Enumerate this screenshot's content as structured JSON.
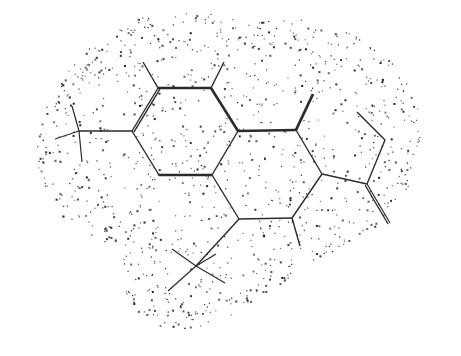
{
  "figure": {
    "type": "molecular-structure-diagram",
    "background_color": "#ffffff",
    "bond_color": "#2b2b2b",
    "dot_color": "#1c1c1c",
    "width": 461,
    "height": 356,
    "caption": ""
  },
  "chart_data": {
    "type": "scatter",
    "xlabel": "",
    "ylabel": "",
    "grid": false,
    "legend": null,
    "xlim": [
      0,
      461
    ],
    "ylim": [
      0,
      356
    ],
    "atoms": [
      {
        "id": "A1",
        "x": 158,
        "y": 88
      },
      {
        "id": "A2",
        "x": 211,
        "y": 88
      },
      {
        "id": "A3",
        "x": 238,
        "y": 131
      },
      {
        "id": "A4",
        "x": 212,
        "y": 175
      },
      {
        "id": "A5",
        "x": 159,
        "y": 175
      },
      {
        "id": "A6",
        "x": 132,
        "y": 131
      },
      {
        "id": "A7",
        "x": 296,
        "y": 130
      },
      {
        "id": "A8",
        "x": 322,
        "y": 174
      },
      {
        "id": "A9",
        "x": 292,
        "y": 218
      },
      {
        "id": "A10",
        "x": 239,
        "y": 219
      },
      {
        "id": "A11",
        "x": 367,
        "y": 184
      },
      {
        "id": "A12",
        "x": 385,
        "y": 140
      },
      {
        "id": "A13",
        "x": 357,
        "y": 112
      },
      {
        "id": "M1",
        "x": 143,
        "y": 62
      },
      {
        "id": "M2",
        "x": 224,
        "y": 62
      },
      {
        "id": "M3",
        "x": 313,
        "y": 94
      },
      {
        "id": "M4",
        "x": 300,
        "y": 246
      },
      {
        "id": "D1",
        "x": 390,
        "y": 223
      },
      {
        "id": "T1",
        "x": 79,
        "y": 131
      },
      {
        "id": "T1a",
        "x": 72,
        "y": 106
      },
      {
        "id": "T1b",
        "x": 55,
        "y": 139
      },
      {
        "id": "T1c",
        "x": 82,
        "y": 162
      },
      {
        "id": "T2",
        "x": 196,
        "y": 266
      },
      {
        "id": "T2a",
        "x": 172,
        "y": 249
      },
      {
        "id": "T2b",
        "x": 168,
        "y": 291
      },
      {
        "id": "T2c",
        "x": 225,
        "y": 283
      },
      {
        "id": "T2d",
        "x": 216,
        "y": 254
      }
    ],
    "bonds": [
      {
        "from": "A1",
        "to": "A2",
        "order": 1,
        "width": 2.6
      },
      {
        "from": "A2",
        "to": "A3",
        "order": 1,
        "width": 2.6
      },
      {
        "from": "A3",
        "to": "A4",
        "order": 1,
        "width": 1.4
      },
      {
        "from": "A4",
        "to": "A5",
        "order": 1,
        "width": 2.6
      },
      {
        "from": "A5",
        "to": "A6",
        "order": 1,
        "width": 1.4
      },
      {
        "from": "A6",
        "to": "A1",
        "order": 2,
        "width": 1.4
      },
      {
        "from": "A3",
        "to": "A7",
        "order": 1,
        "width": 2.6
      },
      {
        "from": "A7",
        "to": "A8",
        "order": 1,
        "width": 1.4
      },
      {
        "from": "A8",
        "to": "A9",
        "order": 1,
        "width": 1.4
      },
      {
        "from": "A9",
        "to": "A10",
        "order": 1,
        "width": 1.4
      },
      {
        "from": "A10",
        "to": "A4",
        "order": 1,
        "width": 1.4
      },
      {
        "from": "A8",
        "to": "A11",
        "order": 1,
        "width": 1.4
      },
      {
        "from": "A11",
        "to": "A12",
        "order": 1,
        "width": 1.4
      },
      {
        "from": "A12",
        "to": "A13",
        "order": 1,
        "width": 1.4
      },
      {
        "from": "A1",
        "to": "M1",
        "order": 1,
        "width": 1.4
      },
      {
        "from": "A2",
        "to": "M2",
        "order": 1,
        "width": 1.4
      },
      {
        "from": "A7",
        "to": "M3",
        "order": 1,
        "width": 2.8
      },
      {
        "from": "A9",
        "to": "M4",
        "order": 1,
        "width": 1.4
      },
      {
        "from": "A11",
        "to": "D1",
        "order": 2,
        "width": 1.2
      },
      {
        "from": "A6",
        "to": "T1",
        "order": 1,
        "width": 1.6
      },
      {
        "from": "T1",
        "to": "T1a",
        "order": 1,
        "width": 1.2
      },
      {
        "from": "T1",
        "to": "T1b",
        "order": 1,
        "width": 1.2
      },
      {
        "from": "T1",
        "to": "T1c",
        "order": 1,
        "width": 1.2
      },
      {
        "from": "A10",
        "to": "T2",
        "order": 1,
        "width": 1.4
      },
      {
        "from": "T2",
        "to": "T2a",
        "order": 1,
        "width": 1.2
      },
      {
        "from": "T2",
        "to": "T2b",
        "order": 1,
        "width": 1.2
      },
      {
        "from": "T2",
        "to": "T2c",
        "order": 1,
        "width": 1.2
      },
      {
        "from": "T2",
        "to": "T2d",
        "order": 1,
        "width": 1.2
      }
    ],
    "surface_dots": {
      "count": 1150,
      "style": "stippled van der Waals dot surface",
      "dot_size_px": [
        1,
        2
      ],
      "hull": [
        [
          108,
          34
        ],
        [
          140,
          18
        ],
        [
          178,
          12
        ],
        [
          215,
          14
        ],
        [
          250,
          20
        ],
        [
          282,
          16
        ],
        [
          312,
          22
        ],
        [
          330,
          34
        ],
        [
          352,
          32
        ],
        [
          372,
          44
        ],
        [
          392,
          62
        ],
        [
          408,
          86
        ],
        [
          420,
          112
        ],
        [
          424,
          140
        ],
        [
          418,
          168
        ],
        [
          406,
          192
        ],
        [
          392,
          212
        ],
        [
          372,
          230
        ],
        [
          348,
          244
        ],
        [
          330,
          254
        ],
        [
          316,
          262
        ],
        [
          300,
          268
        ],
        [
          286,
          280
        ],
        [
          268,
          294
        ],
        [
          248,
          306
        ],
        [
          226,
          318
        ],
        [
          204,
          326
        ],
        [
          180,
          330
        ],
        [
          158,
          326
        ],
        [
          140,
          314
        ],
        [
          128,
          298
        ],
        [
          122,
          280
        ],
        [
          124,
          264
        ],
        [
          118,
          250
        ],
        [
          102,
          240
        ],
        [
          84,
          232
        ],
        [
          66,
          220
        ],
        [
          52,
          204
        ],
        [
          42,
          186
        ],
        [
          36,
          166
        ],
        [
          34,
          146
        ],
        [
          38,
          124
        ],
        [
          46,
          104
        ],
        [
          58,
          84
        ],
        [
          72,
          64
        ],
        [
          88,
          48
        ]
      ]
    }
  }
}
